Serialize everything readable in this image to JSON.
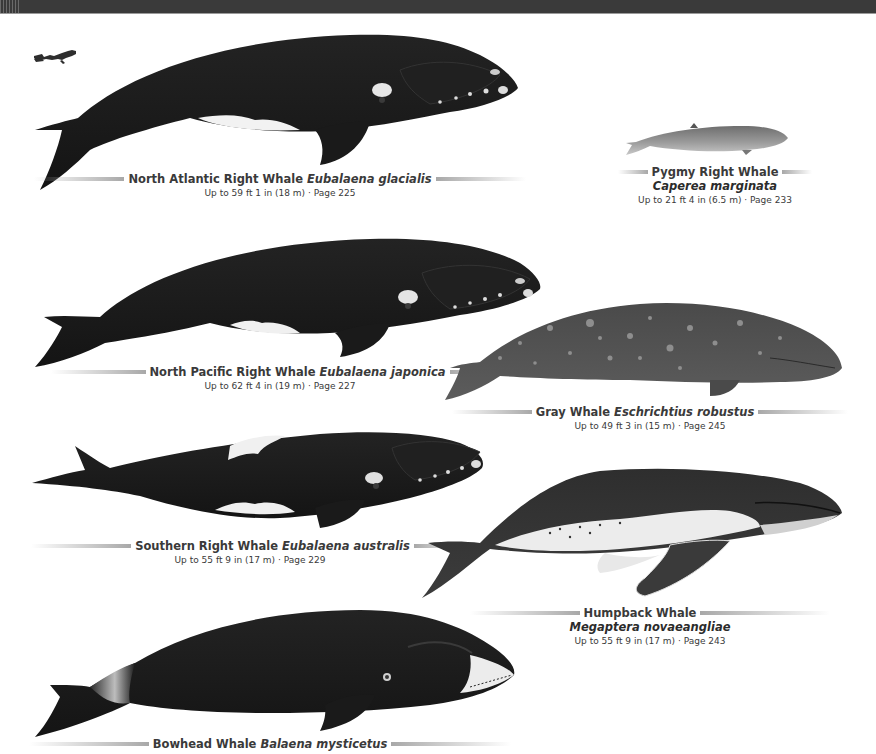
{
  "header": {
    "bar_color": "#3a3a3a"
  },
  "scale_icon": {
    "name": "scuba diver (scale reference)"
  },
  "whales": [
    {
      "id": "north-atlantic-right",
      "common": "North Atlantic Right Whale",
      "scientific": "Eubalaena glacialis",
      "size": "Up to 59 ft 1 in (18 m) · Page 225"
    },
    {
      "id": "pygmy-right",
      "common": "Pygmy Right Whale",
      "scientific": "Caperea marginata",
      "size": "Up to 21 ft 4 in (6.5 m) · Page 233"
    },
    {
      "id": "north-pacific-right",
      "common": "North Pacific Right Whale",
      "scientific": "Eubalaena japonica",
      "size": "Up to 62 ft 4 in (19 m) · Page 227"
    },
    {
      "id": "gray",
      "common": "Gray Whale",
      "scientific": "Eschrichtius robustus",
      "size": "Up to 49 ft 3 in (15 m) · Page 245"
    },
    {
      "id": "southern-right",
      "common": "Southern Right Whale",
      "scientific": "Eubalaena australis",
      "size": "Up to 55 ft 9 in (17 m) · Page 229"
    },
    {
      "id": "humpback",
      "common": "Humpback Whale",
      "scientific": "Megaptera novaeangliae",
      "size": "Up to 55 ft 9 in (17 m) · Page 243"
    },
    {
      "id": "bowhead",
      "common": "Bowhead Whale",
      "scientific": "Balaena mysticetus",
      "size": ""
    }
  ]
}
